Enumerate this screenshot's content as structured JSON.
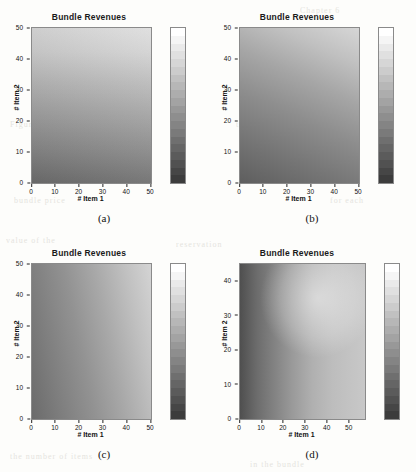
{
  "figure": {
    "caption_a": "(a)",
    "caption_b": "(b)",
    "caption_c": "(c)",
    "caption_d": "(d)"
  },
  "bleed_text": [
    {
      "t": "Chapter 6",
      "x": 300,
      "y": 6
    },
    {
      "t": "revenues of the bundle",
      "x": 48,
      "y": 36
    },
    {
      "t": "surface is concave",
      "x": 60,
      "y": 52
    },
    {
      "t": "Figure",
      "x": 10,
      "y": 120
    },
    {
      "t": "the optimal",
      "x": 236,
      "y": 120
    },
    {
      "t": "bundle price",
      "x": 14,
      "y": 196
    },
    {
      "t": "for each",
      "x": 330,
      "y": 196
    },
    {
      "t": "value of the",
      "x": 6,
      "y": 236
    },
    {
      "t": "reservation",
      "x": 176,
      "y": 240
    },
    {
      "t": "prices and",
      "x": 300,
      "y": 300
    },
    {
      "t": "the number of items",
      "x": 10,
      "y": 452
    },
    {
      "t": "in the bundle",
      "x": 250,
      "y": 460
    }
  ],
  "chart_data": [
    {
      "panel": "a",
      "type": "heatmap",
      "title": "Bundle Revenues",
      "xlabel": "# Item 1",
      "ylabel": "# Item 2",
      "xlim": [
        0,
        50
      ],
      "ylim": [
        0,
        50
      ],
      "xticks": [
        0,
        10,
        20,
        30,
        40,
        50
      ],
      "yticks": [
        0,
        10,
        20,
        30,
        40,
        50
      ],
      "colorbar": {
        "ticks": [
          10,
          20,
          30,
          40
        ],
        "vmin": 0,
        "vmax": 48,
        "bands": 20,
        "colormap": "gray"
      },
      "gradient": {
        "direction": "vertical",
        "low_corner": "bottom",
        "high_corner": "top",
        "comment": "value rises mainly with # Item 2; nearly flat in # Item 1"
      },
      "corner_values": {
        "bottom_left": 4,
        "bottom_right": 6,
        "top_left": 42,
        "top_right": 47
      }
    },
    {
      "panel": "b",
      "type": "heatmap",
      "title": "Bundle Revenues",
      "xlabel": "# Item 1",
      "ylabel": "# Item 2",
      "xlim": [
        0,
        50
      ],
      "ylim": [
        0,
        50
      ],
      "xticks": [
        0,
        10,
        20,
        30,
        40,
        50
      ],
      "yticks": [
        0,
        10,
        20,
        30,
        40,
        50
      ],
      "colorbar": {
        "ticks": [
          0,
          500,
          1000,
          1500,
          2000
        ],
        "vmin": 0,
        "vmax": 2200,
        "bands": 20,
        "colormap": "gray"
      },
      "gradient": {
        "direction": "diagonal",
        "low_corner": "bottom-left",
        "high_corner": "top-right",
        "comment": "value rises with both items, strongest toward top-right"
      },
      "corner_values": {
        "bottom_left": 150,
        "bottom_right": 900,
        "top_left": 1150,
        "top_right": 2150
      }
    },
    {
      "panel": "c",
      "type": "heatmap",
      "title": "Bundle Revenues",
      "xlabel": "# Item 1",
      "ylabel": "# Item 2",
      "xlim": [
        0,
        50
      ],
      "ylim": [
        0,
        50
      ],
      "xticks": [
        0,
        10,
        20,
        30,
        40,
        50
      ],
      "yticks": [
        0,
        10,
        20,
        30,
        40,
        50
      ],
      "colorbar": {
        "ticks": [
          0,
          100,
          200,
          300,
          400,
          500
        ],
        "vmin": 0,
        "vmax": 530,
        "bands": 20,
        "colormap": "gray"
      },
      "gradient": {
        "direction": "horizontal-diagonal",
        "low_corner": "bottom-left",
        "high_corner": "top-right",
        "comment": "value rises mainly with # Item 1, slight rise with # Item 2"
      },
      "corner_values": {
        "bottom_left": 120,
        "bottom_right": 420,
        "top_left": 230,
        "top_right": 520
      }
    },
    {
      "panel": "d",
      "type": "heatmap",
      "title": "Bundle Revenues",
      "xlabel": "# Item 1",
      "ylabel": "# Item 2",
      "xlim": [
        0,
        57
      ],
      "ylim": [
        0,
        45
      ],
      "xticks": [
        0,
        10,
        20,
        30,
        40,
        50
      ],
      "yticks": [
        0,
        10,
        20,
        30,
        40
      ],
      "colorbar": {
        "ticks": [
          0,
          200,
          400,
          600,
          800
        ],
        "vmin": 0,
        "vmax": 800,
        "bands": 20,
        "colormap": "gray"
      },
      "gradient": {
        "direction": "banded-plateau",
        "low_corner": "left-edge",
        "high_corner": "top-center-right",
        "comment": "dark narrow band along left edge, bright plateau top-centre-right, banded contours"
      },
      "corner_values": {
        "bottom_left": 60,
        "bottom_right": 330,
        "top_left": 180,
        "top_right": 640,
        "plateau": 780
      }
    }
  ]
}
